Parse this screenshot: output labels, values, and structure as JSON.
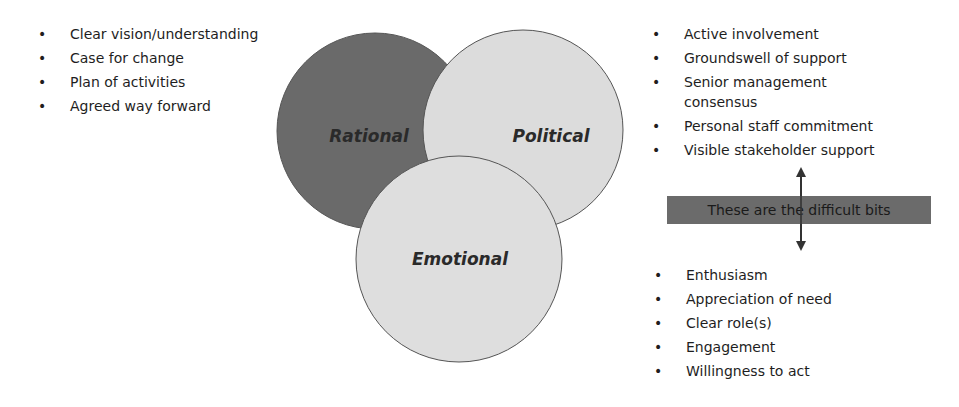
{
  "left_list": {
    "items": [
      "Clear vision/understanding",
      "Case for change",
      "Plan of activities",
      "Agreed way forward"
    ]
  },
  "venn": {
    "circles": [
      {
        "label": "Rational",
        "color": "#6a6a6a"
      },
      {
        "label": "Political",
        "color": "#dcdcdc"
      },
      {
        "label": "Emotional",
        "color": "#dedede"
      }
    ],
    "outline_color": "#555555"
  },
  "right_top_list": {
    "items": [
      "Active involvement",
      "Groundswell of support",
      "Senior management consensus",
      "Personal staff commitment",
      "Visible stakeholder support"
    ]
  },
  "banner": {
    "text": "These are the difficult bits",
    "color": "#6b6b6b"
  },
  "right_bottom_list": {
    "items": [
      "Enthusiasm",
      "Appreciation of need",
      "Clear role(s)",
      "Engagement",
      "Willingness to act"
    ]
  },
  "bullet_glyph": "•"
}
